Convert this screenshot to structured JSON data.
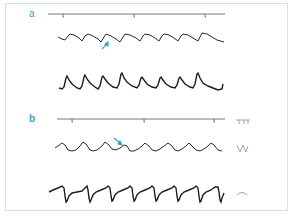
{
  "figure": {
    "panels": [
      {
        "label": "a",
        "traces": [
          "event-marker-line",
          "waveform-upper",
          "waveform-lower"
        ],
        "annotation": "arrow pointing to notch on middle waveform",
        "arrow_color": "#3aa3b8"
      },
      {
        "label": "b",
        "traces": [
          "event-marker-line",
          "waveform-upper",
          "waveform-lower"
        ],
        "annotation": "arrow pointing to notch on middle waveform",
        "arrow_color": "#3aa3b8",
        "legend_glyphs": [
          "square-pulse-glyph",
          "triangle-wave-glyph",
          "bump-glyph"
        ]
      }
    ],
    "colors": {
      "trace": "#2a2a2a",
      "marker_line": "#555555",
      "label": "#3aa3b8",
      "frame": "#cfe4e4",
      "legend_glyph": "#9a9a9a"
    }
  }
}
